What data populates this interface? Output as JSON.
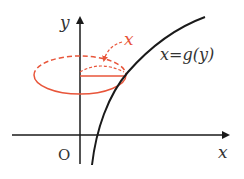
{
  "diagram": {
    "axis_labels": {
      "x": "x",
      "y": "y",
      "origin": "O"
    },
    "curve_label": "x=g(y)",
    "radius_label": "x",
    "colors": {
      "axis": "#1a1a1a",
      "curve": "#1a1a1a",
      "accent": "#e8553a"
    }
  }
}
